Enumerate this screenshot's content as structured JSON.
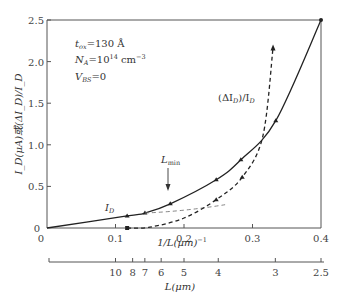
{
  "chart_data": {
    "type": "line",
    "title": "",
    "annotations": {
      "tox": "t_ox=130 Å",
      "na": "N_A=10^14 cm^-3",
      "vbs": "V_BS=0",
      "lmin": "L_min",
      "lmin_x": 0.18
    },
    "xlabel": "1/L(μm)^-1",
    "xlabel2": "L(μm)",
    "ylabel": "I_D(μA)或(ΔI_D)/I_D",
    "xlim": [
      0,
      0.4
    ],
    "ylim": [
      0,
      2.5
    ],
    "x_ticks": [
      "0",
      "0.1",
      "0.2",
      "0.3",
      "0.4"
    ],
    "x_tick_values": [
      0,
      0.1,
      0.2,
      0.3,
      0.4
    ],
    "y_ticks": [
      "0",
      "0.5",
      "1.0",
      "1.5",
      "2.0",
      "2.5"
    ],
    "y_tick_values": [
      0,
      0.5,
      1.0,
      1.5,
      2.0,
      2.5
    ],
    "x2_ticks": [
      "10",
      "8",
      "7",
      "6",
      "5",
      "4",
      "3",
      "2.5"
    ],
    "x2_tick_values": [
      10,
      8,
      7,
      6,
      5,
      4,
      3,
      2.5
    ],
    "grid": false,
    "series": [
      {
        "name": "I_D",
        "style": "solid",
        "x": [
          0,
          0.117,
          0.143,
          0.18,
          0.247,
          0.283,
          0.334,
          0.4
        ],
        "y": [
          0,
          0.145,
          0.18,
          0.29,
          0.58,
          0.82,
          1.29,
          2.5
        ]
      },
      {
        "name": "(ΔI_D)/I_D",
        "style": "dashed",
        "x": [
          0.117,
          0.15,
          0.2,
          0.247,
          0.285,
          0.315,
          0.33
        ],
        "y": [
          0,
          0.01,
          0.12,
          0.34,
          0.61,
          1.1,
          2.17
        ]
      }
    ]
  },
  "labels": {
    "tox_main": "t",
    "tox_sub": "ox",
    "tox_val": "=130 Å",
    "na_main": "N",
    "na_sub": "A",
    "na_val": "=10",
    "na_exp": "14",
    "na_unit": " cm",
    "na_unit_exp": "−3",
    "vbs_main": "V",
    "vbs_sub": "BS",
    "vbs_val": "=0",
    "id_main": "I",
    "id_sub": "D",
    "did_label": "(ΔI",
    "did_sub": "D",
    "did_rest": ")/I",
    "did_sub2": "D",
    "lmin_main": "L",
    "lmin_sub": "min",
    "xlabel": "1/L(μm)",
    "xlabel_exp": "−1",
    "xlabel2": "L(μm)",
    "ylabel": "I_D(μA)或(ΔI_D)/I_D"
  }
}
